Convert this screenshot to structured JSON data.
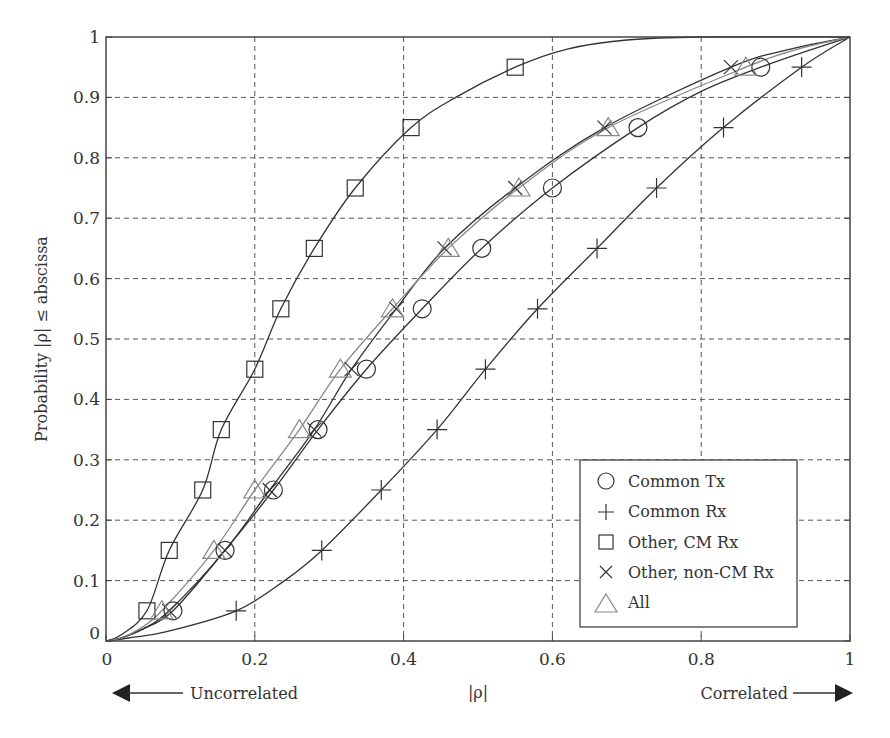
{
  "chart_data": {
    "type": "line",
    "title": "",
    "xlabel": "|ρ|",
    "ylabel": "Probability |ρ| ≤ abscissa",
    "xlim": [
      0,
      1
    ],
    "ylim": [
      0,
      1
    ],
    "grid": true,
    "legend_position": "lower right",
    "x_ticks": [
      "0",
      "0.2",
      "0.4",
      "0.6",
      "0.8",
      "1"
    ],
    "y_ticks": [
      "0",
      "0.1",
      "0.2",
      "0.3",
      "0.4",
      "0.5",
      "0.6",
      "0.7",
      "0.8",
      "0.9",
      "1"
    ],
    "annotations": {
      "left_arrow_label": "Uncorrelated",
      "right_arrow_label": "Correlated"
    },
    "marker_levels": [
      0.05,
      0.15,
      0.25,
      0.35,
      0.45,
      0.55,
      0.65,
      0.75,
      0.85,
      0.95
    ],
    "series": [
      {
        "name": "Common Tx",
        "marker": "circle",
        "color": "#333333",
        "curve": [
          [
            0,
            0
          ],
          [
            0.02,
            0.005
          ],
          [
            0.05,
            0.02
          ],
          [
            0.09,
            0.05
          ],
          [
            0.16,
            0.15
          ],
          [
            0.225,
            0.25
          ],
          [
            0.285,
            0.35
          ],
          [
            0.35,
            0.45
          ],
          [
            0.425,
            0.55
          ],
          [
            0.505,
            0.65
          ],
          [
            0.6,
            0.75
          ],
          [
            0.715,
            0.85
          ],
          [
            0.8,
            0.91
          ],
          [
            0.88,
            0.95
          ],
          [
            0.95,
            0.98
          ],
          [
            1,
            1
          ]
        ],
        "markers_x": [
          0.09,
          0.16,
          0.225,
          0.285,
          0.35,
          0.425,
          0.505,
          0.6,
          0.715,
          0.88
        ]
      },
      {
        "name": "Common Rx",
        "marker": "plus",
        "color": "#333333",
        "curve": [
          [
            0,
            0
          ],
          [
            0.03,
            0.005
          ],
          [
            0.08,
            0.015
          ],
          [
            0.175,
            0.05
          ],
          [
            0.24,
            0.1
          ],
          [
            0.29,
            0.15
          ],
          [
            0.37,
            0.25
          ],
          [
            0.445,
            0.35
          ],
          [
            0.51,
            0.45
          ],
          [
            0.58,
            0.55
          ],
          [
            0.66,
            0.65
          ],
          [
            0.74,
            0.75
          ],
          [
            0.83,
            0.85
          ],
          [
            0.935,
            0.95
          ],
          [
            1,
            1
          ]
        ],
        "markers_x": [
          0.175,
          0.29,
          0.37,
          0.445,
          0.51,
          0.58,
          0.66,
          0.74,
          0.83,
          0.935
        ]
      },
      {
        "name": "Other, CM Rx",
        "marker": "square",
        "color": "#333333",
        "curve": [
          [
            0,
            0
          ],
          [
            0.02,
            0.01
          ],
          [
            0.055,
            0.05
          ],
          [
            0.085,
            0.15
          ],
          [
            0.13,
            0.25
          ],
          [
            0.155,
            0.35
          ],
          [
            0.2,
            0.45
          ],
          [
            0.235,
            0.55
          ],
          [
            0.28,
            0.65
          ],
          [
            0.335,
            0.75
          ],
          [
            0.41,
            0.85
          ],
          [
            0.47,
            0.9
          ],
          [
            0.55,
            0.95
          ],
          [
            0.62,
            0.98
          ],
          [
            0.7,
            0.995
          ],
          [
            0.8,
            1
          ],
          [
            1,
            1
          ]
        ],
        "markers_x": [
          0.055,
          0.085,
          0.13,
          0.155,
          0.2,
          0.235,
          0.28,
          0.335,
          0.41,
          0.55
        ]
      },
      {
        "name": "Other, non-CM Rx",
        "marker": "x",
        "color": "#333333",
        "curve": [
          [
            0,
            0
          ],
          [
            0.02,
            0.005
          ],
          [
            0.05,
            0.02
          ],
          [
            0.085,
            0.05
          ],
          [
            0.16,
            0.15
          ],
          [
            0.22,
            0.25
          ],
          [
            0.28,
            0.35
          ],
          [
            0.33,
            0.45
          ],
          [
            0.39,
            0.55
          ],
          [
            0.455,
            0.65
          ],
          [
            0.55,
            0.75
          ],
          [
            0.67,
            0.85
          ],
          [
            0.84,
            0.95
          ],
          [
            0.92,
            0.98
          ],
          [
            1,
            1
          ]
        ],
        "markers_x": [
          0.085,
          0.16,
          0.22,
          0.28,
          0.33,
          0.39,
          0.455,
          0.55,
          0.67,
          0.84
        ]
      },
      {
        "name": "All",
        "marker": "triangle",
        "color": "#888888",
        "curve": [
          [
            0,
            0
          ],
          [
            0.02,
            0.005
          ],
          [
            0.045,
            0.02
          ],
          [
            0.075,
            0.05
          ],
          [
            0.145,
            0.15
          ],
          [
            0.2,
            0.25
          ],
          [
            0.26,
            0.35
          ],
          [
            0.315,
            0.45
          ],
          [
            0.385,
            0.55
          ],
          [
            0.46,
            0.65
          ],
          [
            0.555,
            0.75
          ],
          [
            0.675,
            0.85
          ],
          [
            0.86,
            0.95
          ],
          [
            0.93,
            0.98
          ],
          [
            1,
            1
          ]
        ],
        "markers_x": [
          0.075,
          0.145,
          0.2,
          0.26,
          0.315,
          0.385,
          0.46,
          0.555,
          0.675,
          0.86
        ]
      }
    ]
  },
  "legend": {
    "items": [
      {
        "label": "Common Tx",
        "icon": "circle-marker-icon"
      },
      {
        "label": "Common Rx",
        "icon": "plus-marker-icon"
      },
      {
        "label": "Other, CM Rx",
        "icon": "square-marker-icon"
      },
      {
        "label": "Other, non-CM Rx",
        "icon": "x-marker-icon"
      },
      {
        "label": "All",
        "icon": "triangle-marker-icon"
      }
    ]
  },
  "labels": {
    "ylabel": "Probability |ρ| ≤ abscissa",
    "xlabel": "|ρ|",
    "uncorrelated": "Uncorrelated",
    "correlated": "Correlated",
    "origin_y": "0"
  }
}
